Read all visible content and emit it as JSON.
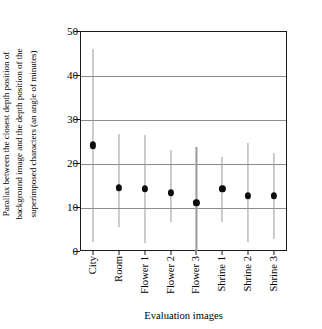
{
  "chart_data": {
    "type": "scatter",
    "title": "",
    "subtitle": "",
    "xlabel": "Evaluation images",
    "ylabel": "Parallax between the closest depth position of background image and the depth position of the superimposed characters (an angle of minutes)",
    "categories": [
      "City",
      "Room",
      "Flower 1",
      "Flower 2",
      "Flower 3",
      "Shrine 1",
      "Shrine 2",
      "Shrine 3"
    ],
    "values": [
      24.0,
      14.3,
      14.1,
      13.2,
      11.0,
      14.1,
      12.6,
      12.6
    ],
    "error_high": [
      46.0,
      26.5,
      26.3,
      23.0,
      23.7,
      21.3,
      24.5,
      22.2
    ],
    "error_low": [
      2.0,
      5.5,
      1.8,
      6.5,
      0.0,
      6.5,
      2.0,
      2.8
    ],
    "ylim": [
      0,
      50
    ],
    "yticks": [
      0,
      10,
      20,
      30,
      40,
      50
    ],
    "ytick_labels": [
      "0",
      "10",
      "20",
      "30",
      "40",
      "50"
    ],
    "grid": true,
    "grid_axis": "y",
    "legend": false,
    "legend_position": "none",
    "marker": "filled-circle",
    "marker_color": "#0d0d0d",
    "errorbar_color": "#9a9a9a",
    "axis_color": "#1a1a1a",
    "grid_color": "#8c8c8c",
    "background_color": "#ffffff"
  },
  "axes": {
    "y_title_text": "Parallax between the closest depth position of\nbackground image and the depth position of the\nsuperimposed characters (an angle of minutes)",
    "x_title_text": "Evaluation images"
  }
}
